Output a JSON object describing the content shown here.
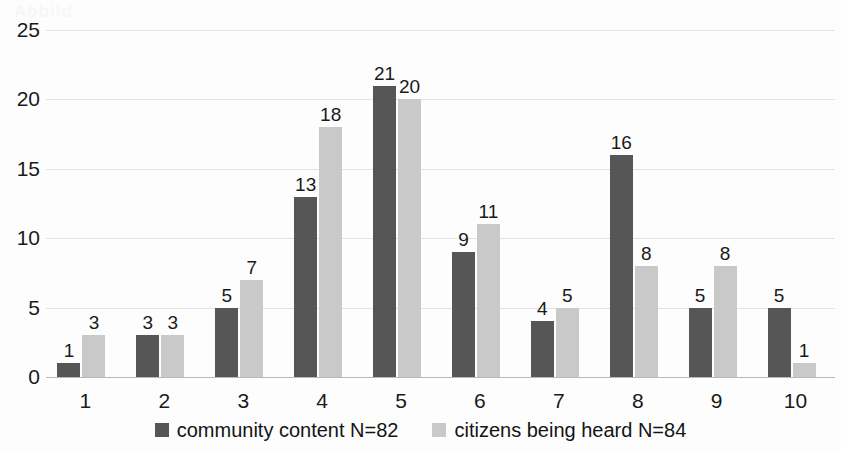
{
  "ghost_text": "Abbild",
  "chart_data": {
    "type": "bar",
    "title": "",
    "subtitle": "",
    "xlabel": "",
    "ylabel": "",
    "categories": [
      "1",
      "2",
      "3",
      "4",
      "5",
      "6",
      "7",
      "8",
      "9",
      "10"
    ],
    "series": [
      {
        "name": "community content N=82",
        "color": "#565656",
        "values": [
          1,
          3,
          5,
          13,
          21,
          9,
          4,
          16,
          5,
          5
        ]
      },
      {
        "name": "citizens being heard N=84",
        "color": "#c9c9c9",
        "values": [
          3,
          3,
          7,
          18,
          20,
          11,
          5,
          8,
          8,
          1
        ]
      }
    ],
    "ylim": [
      0,
      25
    ],
    "y_ticks": [
      0,
      5,
      10,
      15,
      20,
      25
    ],
    "grid": true,
    "data_labels": true,
    "legend_position": "bottom"
  }
}
